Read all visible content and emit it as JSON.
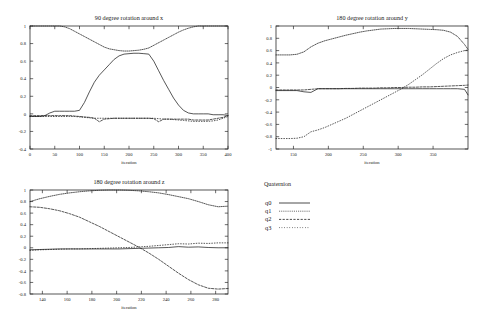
{
  "figure": {
    "series_names": [
      "q0",
      "q1",
      "q2",
      "q3"
    ],
    "xlabel": "iteration",
    "line_color": "#1f1f1f"
  },
  "legend": {
    "title": "Quaternion",
    "entries": [
      {
        "label": "q0",
        "style": "solid"
      },
      {
        "label": "q1",
        "style": "fine-dotted"
      },
      {
        "label": "q2",
        "style": "dashed"
      },
      {
        "label": "q3",
        "style": "dotted"
      }
    ]
  },
  "chart_data": [
    {
      "id": "rotation-x",
      "type": "line",
      "title": "90 degree rotation around x",
      "xlabel": "iteration",
      "ylabel": "",
      "xlim": [
        0,
        400
      ],
      "ylim": [
        -0.4,
        1.0
      ],
      "xticks": [
        0,
        50,
        100,
        150,
        200,
        250,
        300,
        350,
        400
      ],
      "yticks": [
        -0.4,
        -0.2,
        0,
        0.2,
        0.4,
        0.6,
        0.8,
        1
      ],
      "grid": false,
      "legend_position": "external-right-bottom",
      "x": [
        0,
        10,
        20,
        30,
        40,
        50,
        60,
        70,
        80,
        90,
        100,
        110,
        120,
        130,
        140,
        150,
        160,
        170,
        180,
        190,
        200,
        210,
        220,
        230,
        240,
        250,
        260,
        270,
        280,
        290,
        300,
        310,
        320,
        330,
        340,
        350,
        360,
        370,
        380,
        390,
        400
      ],
      "series": [
        {
          "name": "q0",
          "style": "solid",
          "values": [
            -0.03,
            -0.03,
            -0.03,
            -0.02,
            0.01,
            0.03,
            0.03,
            0.03,
            0.03,
            0.03,
            0.04,
            0.13,
            0.25,
            0.36,
            0.44,
            0.5,
            0.56,
            0.62,
            0.66,
            0.68,
            0.685,
            0.69,
            0.69,
            0.685,
            0.68,
            0.6,
            0.49,
            0.38,
            0.28,
            0.18,
            0.1,
            0.04,
            0.01,
            0.0,
            0.0,
            0.0,
            0.0,
            -0.01,
            -0.01,
            -0.01,
            -0.02
          ]
        },
        {
          "name": "q1",
          "style": "fine-dotted",
          "values": [
            1.0,
            1.0,
            1.0,
            1.0,
            1.0,
            1.0,
            1.0,
            0.99,
            0.97,
            0.94,
            0.91,
            0.88,
            0.85,
            0.82,
            0.79,
            0.76,
            0.74,
            0.73,
            0.72,
            0.715,
            0.715,
            0.72,
            0.725,
            0.735,
            0.75,
            0.78,
            0.81,
            0.84,
            0.87,
            0.9,
            0.93,
            0.955,
            0.975,
            0.99,
            1.0,
            1.0,
            1.0,
            1.0,
            1.0,
            1.0,
            1.0
          ]
        },
        {
          "name": "q2",
          "style": "dashed",
          "values": [
            -0.02,
            -0.02,
            -0.02,
            -0.02,
            -0.02,
            -0.02,
            -0.02,
            -0.02,
            -0.02,
            -0.025,
            -0.03,
            -0.035,
            -0.04,
            -0.05,
            -0.09,
            -0.06,
            -0.055,
            -0.05,
            -0.05,
            -0.05,
            -0.05,
            -0.05,
            -0.05,
            -0.05,
            -0.05,
            -0.055,
            -0.09,
            -0.06,
            -0.06,
            -0.06,
            -0.06,
            -0.06,
            -0.06,
            -0.07,
            -0.07,
            -0.07,
            -0.07,
            -0.06,
            -0.05,
            -0.04,
            -0.02
          ]
        },
        {
          "name": "q3",
          "style": "dotted",
          "values": [
            -0.03,
            -0.03,
            -0.03,
            -0.03,
            -0.03,
            -0.03,
            -0.03,
            -0.03,
            -0.03,
            -0.03,
            -0.035,
            -0.04,
            -0.045,
            -0.05,
            -0.05,
            -0.05,
            -0.05,
            -0.05,
            -0.05,
            -0.05,
            -0.05,
            -0.05,
            -0.05,
            -0.05,
            -0.05,
            -0.05,
            -0.055,
            -0.06,
            -0.06,
            -0.065,
            -0.07,
            -0.075,
            -0.08,
            -0.085,
            -0.085,
            -0.085,
            -0.085,
            -0.08,
            -0.07,
            -0.05,
            -0.03
          ]
        }
      ]
    },
    {
      "id": "rotation-y",
      "type": "line",
      "title": "180 degree rotation around y",
      "xlabel": "iteration",
      "ylabel": "",
      "xlim": [
        125,
        400
      ],
      "ylim": [
        -1.0,
        1.0
      ],
      "xticks": [
        150,
        200,
        250,
        300,
        350
      ],
      "yticks": [
        -1,
        -0.8,
        -0.6,
        -0.4,
        -0.2,
        0,
        0.2,
        0.4,
        0.6,
        0.8,
        1
      ],
      "grid": false,
      "legend_position": "external-right-bottom",
      "x": [
        125,
        135,
        145,
        155,
        165,
        175,
        185,
        195,
        205,
        215,
        225,
        235,
        245,
        255,
        265,
        275,
        285,
        295,
        305,
        315,
        325,
        335,
        345,
        355,
        365,
        375,
        385,
        395,
        400
      ],
      "series": [
        {
          "name": "q0",
          "style": "solid",
          "values": [
            -0.05,
            -0.05,
            -0.05,
            -0.05,
            -0.07,
            -0.08,
            -0.02,
            -0.02,
            -0.02,
            -0.02,
            -0.02,
            -0.02,
            -0.02,
            -0.02,
            -0.02,
            -0.02,
            -0.02,
            -0.02,
            -0.02,
            -0.02,
            -0.02,
            -0.02,
            -0.02,
            -0.02,
            -0.02,
            -0.02,
            -0.02,
            -0.03,
            -0.12
          ]
        },
        {
          "name": "q1",
          "style": "fine-dotted",
          "values": [
            0.53,
            0.53,
            0.53,
            0.54,
            0.58,
            0.66,
            0.72,
            0.76,
            0.79,
            0.82,
            0.85,
            0.875,
            0.9,
            0.92,
            0.935,
            0.95,
            0.955,
            0.96,
            0.96,
            0.96,
            0.955,
            0.95,
            0.945,
            0.94,
            0.93,
            0.9,
            0.83,
            0.7,
            0.62
          ]
        },
        {
          "name": "q2",
          "style": "dashed",
          "values": [
            -0.04,
            -0.04,
            -0.04,
            -0.04,
            -0.04,
            -0.03,
            -0.02,
            -0.02,
            -0.02,
            -0.02,
            -0.015,
            -0.015,
            -0.01,
            -0.01,
            -0.01,
            -0.005,
            -0.005,
            0.0,
            0.0,
            0.005,
            0.005,
            0.01,
            0.01,
            0.015,
            0.02,
            0.025,
            0.03,
            0.035,
            0.04
          ]
        },
        {
          "name": "q3",
          "style": "dotted",
          "values": [
            -0.83,
            -0.83,
            -0.83,
            -0.825,
            -0.8,
            -0.72,
            -0.69,
            -0.65,
            -0.6,
            -0.55,
            -0.5,
            -0.44,
            -0.38,
            -0.32,
            -0.26,
            -0.2,
            -0.14,
            -0.08,
            -0.02,
            0.05,
            0.13,
            0.21,
            0.3,
            0.39,
            0.47,
            0.53,
            0.57,
            0.6,
            0.61
          ]
        }
      ]
    },
    {
      "id": "rotation-z",
      "type": "line",
      "title": "180 degree rotation around z",
      "xlabel": "iteration",
      "ylabel": "",
      "xlim": [
        130,
        290
      ],
      "ylim": [
        -0.8,
        1.0
      ],
      "xticks": [
        140,
        160,
        180,
        200,
        220,
        240,
        260,
        280
      ],
      "yticks": [
        -0.8,
        -0.6,
        -0.4,
        -0.2,
        0,
        0.2,
        0.4,
        0.6,
        0.8,
        1
      ],
      "grid": false,
      "legend_position": "external-right-bottom",
      "x": [
        130,
        138,
        146,
        154,
        162,
        170,
        178,
        186,
        194,
        202,
        210,
        218,
        226,
        234,
        242,
        250,
        258,
        266,
        274,
        282,
        290
      ],
      "series": [
        {
          "name": "q0",
          "style": "solid",
          "values": [
            -0.035,
            -0.03,
            -0.025,
            -0.02,
            -0.02,
            -0.02,
            -0.02,
            -0.02,
            -0.02,
            -0.02,
            -0.015,
            -0.01,
            -0.005,
            0.0,
            0.005,
            0.02,
            0.01,
            0.015,
            0.005,
            0.0,
            0.0
          ]
        },
        {
          "name": "q1",
          "style": "fine-dotted",
          "values": [
            0.8,
            0.85,
            0.89,
            0.925,
            0.95,
            0.97,
            0.985,
            0.995,
            1.0,
            1.0,
            0.995,
            0.985,
            0.97,
            0.95,
            0.92,
            0.885,
            0.85,
            0.8,
            0.745,
            0.71,
            0.72
          ]
        },
        {
          "name": "q2",
          "style": "dashed",
          "values": [
            0.71,
            0.7,
            0.675,
            0.64,
            0.59,
            0.53,
            0.45,
            0.37,
            0.28,
            0.19,
            0.1,
            0.01,
            -0.09,
            -0.2,
            -0.32,
            -0.44,
            -0.55,
            -0.64,
            -0.7,
            -0.715,
            -0.705
          ]
        },
        {
          "name": "q3",
          "style": "dotted",
          "values": [
            -0.045,
            -0.035,
            -0.03,
            -0.025,
            -0.02,
            -0.02,
            -0.015,
            -0.01,
            -0.005,
            0.0,
            0.005,
            0.015,
            0.025,
            0.04,
            0.055,
            0.07,
            0.065,
            0.08,
            0.075,
            0.085,
            0.085
          ]
        }
      ]
    }
  ]
}
